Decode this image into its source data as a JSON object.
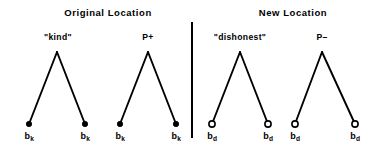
{
  "figure": {
    "background_color": "#ffffff",
    "ink_color": "#000000",
    "panels": [
      {
        "id": "original",
        "title": "Original Location",
        "title_x": 108,
        "title_y": 8,
        "trees": [
          {
            "id": "kind",
            "apex_label": "\"kind\"",
            "apex_label_x": 58,
            "apex_label_y": 33,
            "apex_x": 57,
            "apex_y": 52,
            "node_style": "filled",
            "leaves": [
              {
                "label": "b",
                "subscript": "k",
                "x": 29,
                "y": 124,
                "label_x": 29,
                "label_y": 132
              },
              {
                "label": "b",
                "subscript": "k",
                "x": 85,
                "y": 124,
                "label_x": 85,
                "label_y": 132
              }
            ]
          },
          {
            "id": "p-plus",
            "apex_label": "P+",
            "apex_label_x": 148,
            "apex_label_y": 33,
            "apex_x": 148,
            "apex_y": 52,
            "node_style": "filled",
            "leaves": [
              {
                "label": "b",
                "subscript": "k",
                "x": 120,
                "y": 124,
                "label_x": 120,
                "label_y": 132
              },
              {
                "label": "b",
                "subscript": "k",
                "x": 176,
                "y": 124,
                "label_x": 176,
                "label_y": 132
              }
            ]
          }
        ]
      },
      {
        "id": "new",
        "title": "New Location",
        "title_x": 293,
        "title_y": 8,
        "trees": [
          {
            "id": "dishonest",
            "apex_label": "\"dishonest\"",
            "apex_label_x": 240,
            "apex_label_y": 33,
            "apex_x": 240,
            "apex_y": 52,
            "node_style": "hollow",
            "leaves": [
              {
                "label": "b",
                "subscript": "d",
                "x": 212,
                "y": 124,
                "label_x": 212,
                "label_y": 132
              },
              {
                "label": "b",
                "subscript": "d",
                "x": 268,
                "y": 124,
                "label_x": 268,
                "label_y": 132
              }
            ]
          },
          {
            "id": "p-minus",
            "apex_label": "P–",
            "apex_label_x": 322,
            "apex_label_y": 33,
            "apex_x": 322,
            "apex_y": 52,
            "node_style": "hollow",
            "leaves": [
              {
                "label": "b",
                "subscript": "d",
                "x": 295,
                "y": 124,
                "label_x": 295,
                "label_y": 132
              },
              {
                "label": "b",
                "subscript": "d",
                "x": 355,
                "y": 124,
                "label_x": 355,
                "label_y": 132
              }
            ]
          }
        ]
      }
    ],
    "divider": {
      "x": 192,
      "y_top": 22,
      "y_bottom": 138,
      "width": 2
    },
    "branch_width": 1.9,
    "node_radius": 3.1,
    "node_outline_width": 1.6
  }
}
